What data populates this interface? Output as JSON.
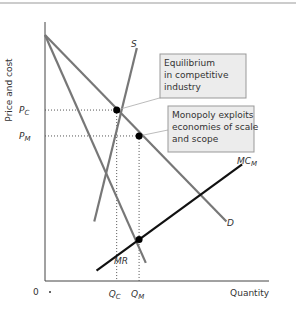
{
  "chart_data": {
    "type": "line",
    "title": "",
    "xlabel": "Quantity",
    "ylabel": "Price and cost",
    "origin_label": "0",
    "x_ticks": [
      {
        "label": "Q",
        "sub": "C",
        "x": 0.32
      },
      {
        "label": "Q",
        "sub": "M",
        "x": 0.42
      }
    ],
    "y_ticks": [
      {
        "label": "P",
        "sub": "C",
        "y": 0.66
      },
      {
        "label": "P",
        "sub": "M",
        "y": 0.56
      }
    ],
    "series": [
      {
        "name": "D",
        "points": [
          [
            0,
            0.95
          ],
          [
            0.81,
            0.23
          ]
        ],
        "color": "#777"
      },
      {
        "name": "MR",
        "points": [
          [
            0,
            0.95
          ],
          [
            0.45,
            0.07
          ]
        ],
        "color": "#777"
      },
      {
        "name": "S",
        "points": [
          [
            0.22,
            0.23
          ],
          [
            0.41,
            0.9
          ]
        ],
        "color": "#777"
      },
      {
        "name": "MC",
        "sub": "M",
        "points": [
          [
            0.23,
            0.04
          ],
          [
            0.88,
            0.45
          ]
        ],
        "color": "#111"
      }
    ],
    "points": [
      {
        "name": "competitive-equilibrium",
        "x": 0.32,
        "y": 0.66
      },
      {
        "name": "monopoly-price",
        "x": 0.42,
        "y": 0.56
      },
      {
        "name": "mr-mc-intersection",
        "x": 0.42,
        "y": 0.16
      }
    ],
    "annotations": [
      {
        "lines": [
          "Equilibrium",
          "in competitive",
          "industry"
        ]
      },
      {
        "lines": [
          "Monopoly exploits",
          "economies of scale",
          "and scope"
        ]
      }
    ]
  }
}
